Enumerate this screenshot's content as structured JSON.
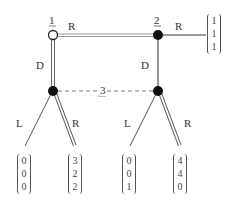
{
  "diagram": {
    "type": "extensive-form game tree",
    "nodes": [
      {
        "id": "n1",
        "player_label": "1",
        "style": "hollow",
        "x": 53,
        "y": 35
      },
      {
        "id": "n2",
        "player_label": "2",
        "style": "filled",
        "x": 158,
        "y": 35
      },
      {
        "id": "n3a",
        "player_label": "",
        "style": "filled",
        "x": 53,
        "y": 91
      },
      {
        "id": "n3b",
        "player_label": "",
        "style": "filled",
        "x": 158,
        "y": 91
      }
    ],
    "information_set": {
      "label": "3",
      "connects": [
        "n3a",
        "n3b"
      ],
      "style": "dashed"
    },
    "edges": [
      {
        "from": "n1",
        "to": "n2",
        "label": "R",
        "style": "double"
      },
      {
        "from": "n2",
        "to": "p1",
        "label": "R",
        "style": "single"
      },
      {
        "from": "n1",
        "to": "n3a",
        "label": "D",
        "style": "double"
      },
      {
        "from": "n2",
        "to": "n3b",
        "label": "D",
        "style": "single"
      },
      {
        "from": "n3a",
        "to": "p2",
        "label": "L",
        "style": "single"
      },
      {
        "from": "n3a",
        "to": "p3",
        "label": "R",
        "style": "double"
      },
      {
        "from": "n3b",
        "to": "p4",
        "label": "L",
        "style": "single"
      },
      {
        "from": "n3b",
        "to": "p5",
        "label": "R",
        "style": "double"
      }
    ],
    "payoffs": [
      {
        "id": "p1",
        "values": [
          "1",
          "1",
          "1"
        ]
      },
      {
        "id": "p2",
        "values": [
          "0",
          "0",
          "0"
        ]
      },
      {
        "id": "p3",
        "values": [
          "3",
          "2",
          "2"
        ]
      },
      {
        "id": "p4",
        "values": [
          "0",
          "0",
          "1"
        ]
      },
      {
        "id": "p5",
        "values": [
          "4",
          "4",
          "0"
        ]
      }
    ],
    "labels": {
      "player1": "1",
      "player2": "2",
      "player3": "3",
      "n1_right": "R",
      "n2_right": "R",
      "n1_down": "D",
      "n2_down": "D",
      "n3a_left": "L",
      "n3a_right": "R",
      "n3b_left": "L",
      "n3b_right": "R"
    },
    "colors": {
      "line": "#555555",
      "top_line": "#888888",
      "node_fill": "#111111",
      "dashed": "#666666"
    }
  }
}
